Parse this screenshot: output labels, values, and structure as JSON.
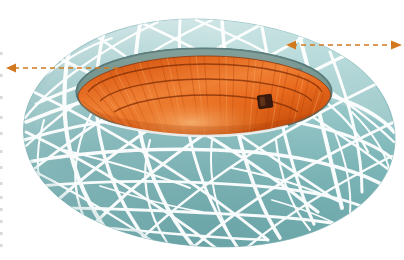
{
  "figure": {
    "title": "Oval woven-lattice stadium with open roof",
    "subject": "stadium",
    "view": "three-quarter aerial perspective",
    "background_color": "#ffffff"
  },
  "structure": {
    "shell": {
      "name": "woven lattice facade",
      "base_color": "#96c6c8",
      "highlight_color": "#cde4e4",
      "shadow_color": "#6fa7aa",
      "lattice_color": "#ffffff",
      "lattice_strand_count": 46,
      "outline_color": "#7fb3b6"
    },
    "opening": {
      "name": "oval roof opening",
      "rim_color": "#5f8b8d",
      "far_wall_color": "#7f9f9b",
      "center_x": 204,
      "center_y": 92,
      "radius_x": 128,
      "radius_y": 44
    },
    "bowl": {
      "name": "interior seating bowl",
      "seating_color": "#e0651f",
      "seating_highlight": "#f5a15a",
      "seating_shadow": "#b4450f",
      "tier_count": 3,
      "radial_stripe_count": 34
    },
    "screen": {
      "name": "video scoreboard",
      "color": "#3a1a0e",
      "x": 258,
      "y": 95,
      "width": 14,
      "height": 13
    }
  },
  "annotations": {
    "color": "#d2791f",
    "style": "dashed",
    "arrows": [
      {
        "id": "left-dimension-arrow",
        "label": "",
        "heads": "single",
        "direction": "left",
        "x1": 118,
        "y1": 68,
        "x2": 8,
        "y2": 68
      },
      {
        "id": "right-dimension-arrow",
        "label": "",
        "heads": "double",
        "direction": "right",
        "x1": 288,
        "y1": 45,
        "x2": 400,
        "y2": 45
      }
    ]
  },
  "margin_marks": {
    "name": "scan edge tick marks",
    "color": "#b9b9b9",
    "count": 13,
    "x": 1
  }
}
